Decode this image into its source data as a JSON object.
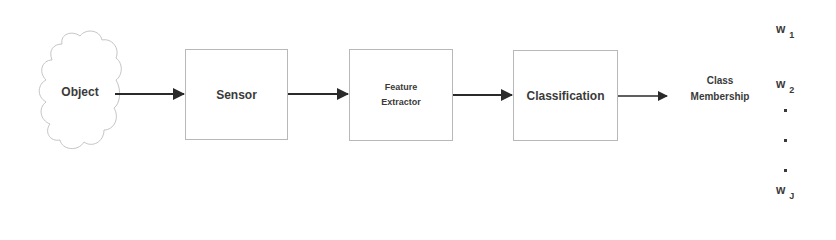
{
  "diagram": {
    "type": "pattern-recognition-pipeline",
    "nodes": [
      {
        "id": "object",
        "label": "Object",
        "shape": "cloud"
      },
      {
        "id": "sensor",
        "label": "Sensor",
        "shape": "rectangle"
      },
      {
        "id": "feature_extractor",
        "label_line1": "Feature",
        "label_line2": "Extractor",
        "shape": "rectangle"
      },
      {
        "id": "classification",
        "label": "Classification",
        "shape": "rectangle"
      }
    ],
    "edges": [
      {
        "from": "object",
        "to": "sensor"
      },
      {
        "from": "sensor",
        "to": "feature_extractor"
      },
      {
        "from": "feature_extractor",
        "to": "classification"
      },
      {
        "from": "classification",
        "to": "class_membership"
      }
    ],
    "output": {
      "label_line1": "Class",
      "label_line2": "Membership",
      "classes": [
        {
          "base": "w",
          "sub": "1"
        },
        {
          "base": "w",
          "sub": "2"
        },
        {
          "base": "w",
          "sub": "J"
        }
      ],
      "ellipsis_dots": 3
    },
    "colors": {
      "stroke": "#b8b8b8",
      "arrow": "#2a2a2a",
      "text": "#3a3a3a"
    }
  }
}
